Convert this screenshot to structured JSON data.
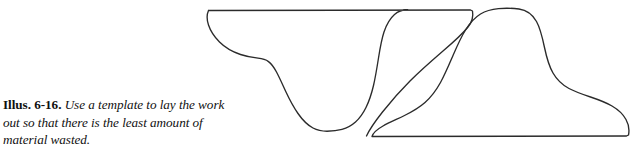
{
  "figure": {
    "caption": {
      "label": "Illus. 6-16.",
      "text": "Use a template to lay the work out so that there is the least amount of material wasted."
    },
    "background_color": "#ffffff",
    "line_color": "#2b2b2b",
    "drawing": {
      "type": "line-drawing",
      "description": "Two nested woodturning profile templates arranged to minimize material waste",
      "shapes": [
        {
          "name": "upper-bowl-profile",
          "description": "Upward-opening bowl profile with flat top rim and deep central valley",
          "top_rim_y": 10,
          "top_rim_left_x": 208,
          "top_rim_right_x": 472,
          "valley_bottom_y": 130,
          "valley_center_x": 330
        },
        {
          "name": "lower-dome-profile",
          "description": "Downward dome / foot profile with flat base and rounded peak",
          "base_y": 136,
          "base_left_x": 372,
          "base_right_x": 628,
          "peak_y": 12,
          "peak_center_x": 505
        }
      ]
    }
  }
}
